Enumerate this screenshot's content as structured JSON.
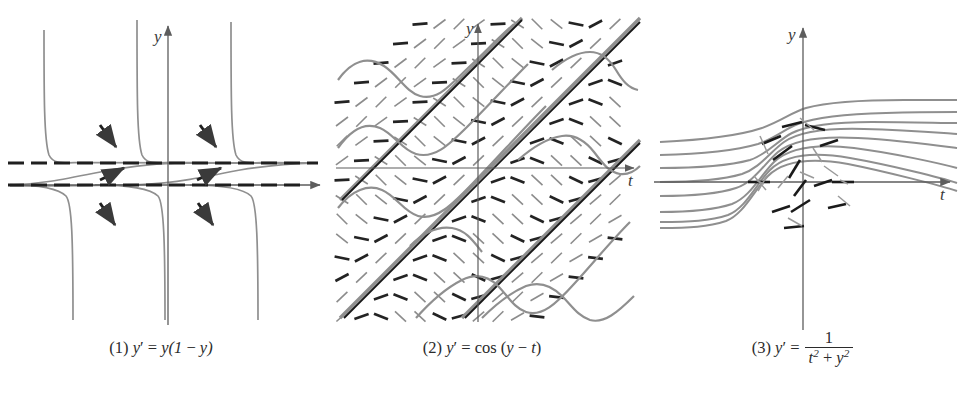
{
  "figure": {
    "background": "#ffffff",
    "curve_color": "#8a8a8a",
    "axis_color": "#6e6e6e",
    "field_color": "#2b2b2b",
    "text_color": "#2b2b2b",
    "width": 964,
    "height": 401
  },
  "panels": [
    {
      "id": "panel-1",
      "number": "(1)",
      "equation_plain": "y' = y(1 - y)",
      "caption_parts": {
        "index": "(1)",
        "lhs": "y",
        "prime": "′",
        "eq": "=",
        "rhs_pre": "y(1",
        "minus": "−",
        "rhs_post": "y)"
      },
      "axis_x_label": "t",
      "axis_y_label": "y",
      "equilibria": [
        {
          "y_value": 1,
          "style": "dashed",
          "label": "y = 1"
        },
        {
          "y_value": 0,
          "style": "dashed-axis",
          "label": "y = 0"
        }
      ],
      "arrow_count": 6,
      "arrow_directions": [
        "down",
        "down",
        "up",
        "up",
        "down",
        "down"
      ],
      "asymptote_t_values": [
        -2.1,
        -0.25,
        1.55,
        3.2
      ]
    },
    {
      "id": "panel-2",
      "number": "(2)",
      "equation_plain": "y' = cos (y - t)",
      "caption_parts": {
        "index": "(2)",
        "lhs": "y",
        "prime": "′",
        "eq": "=",
        "fn": "cos",
        "arg_open": "(",
        "arg_y": "y",
        "minus": "−",
        "arg_t": "t",
        "arg_close": ")"
      },
      "axis_x_label": "t",
      "axis_y_label": "y",
      "field_type": "slope-field",
      "field_grid_spacing_px": 19.5,
      "isocline_slope": 1,
      "straight_solution_count": 4
    },
    {
      "id": "panel-3",
      "number": "(3)",
      "equation_plain": "y' = 1/(t^2 + y^2)",
      "caption_parts": {
        "index": "(3)",
        "lhs": "y",
        "prime": "′",
        "eq": "=",
        "numerator": "1",
        "den_t": "t",
        "den_t_exp": "2",
        "plus": "+",
        "den_y": "y",
        "den_y_exp": "2"
      },
      "axis_x_label": "t",
      "axis_y_label": "y",
      "solution_curve_count": 7,
      "field_marks_region": "near-origin"
    }
  ]
}
